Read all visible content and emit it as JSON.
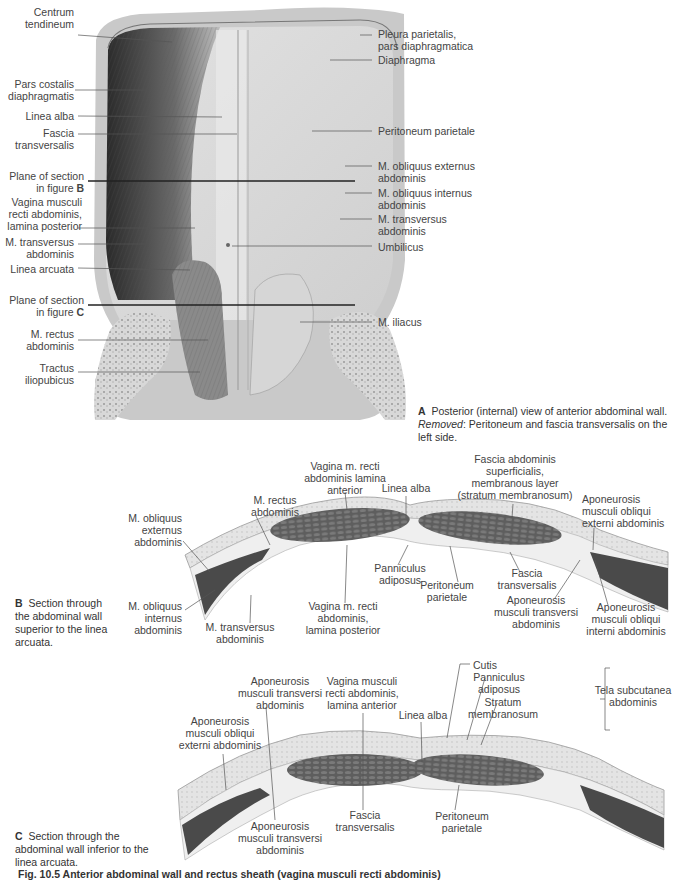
{
  "figure_a": {
    "labels_left": [
      {
        "text": "Centrum\ntendineum",
        "x": 28,
        "y": 11
      },
      {
        "text": "Pars costalis\ndiaphragmatis",
        "x": 8,
        "y": 82
      },
      {
        "text": "Linea alba",
        "x": 30,
        "y": 111
      },
      {
        "text": "Fascia\ntransversalis",
        "x": 20,
        "y": 128
      },
      {
        "text": "Plane of section\nin figure ",
        "bold": "B",
        "x": 20,
        "y": 169
      },
      {
        "text": "Vagina musculi\nrecti abdominis,\nlamina posterior",
        "x": 15,
        "y": 195
      },
      {
        "text": "M. transversus\nabdominis",
        "x": 12,
        "y": 238
      },
      {
        "text": "Linea arcuata",
        "x": 17,
        "y": 265
      },
      {
        "text": "Plane of section\nin figure ",
        "bold": "C",
        "x": 20,
        "y": 295
      },
      {
        "text": "M. rectus\nabdominis",
        "x": 30,
        "y": 328
      },
      {
        "text": "Tractus\niliopubicus",
        "x": 28,
        "y": 363
      }
    ],
    "labels_right": [
      {
        "text": "Pleura parietalis,\npars diaphragmatica",
        "x": 378,
        "y": 28
      },
      {
        "text": "Diaphragma",
        "x": 378,
        "y": 54
      },
      {
        "text": "Peritoneum parietale",
        "x": 378,
        "y": 125
      },
      {
        "text": "M. obliquus externus\nabdominis",
        "x": 378,
        "y": 161
      },
      {
        "text": "M. obliquus internus\nabdominis",
        "x": 378,
        "y": 188
      },
      {
        "text": "M. transversus\nabdominis",
        "x": 378,
        "y": 214
      },
      {
        "text": "Umbilicus",
        "x": 378,
        "y": 241
      },
      {
        "text": "M. iliacus",
        "x": 378,
        "y": 316
      }
    ],
    "caption_letter": "A",
    "caption_text": "Posterior (internal) view of anterior abdominal wall.",
    "caption_removed_label": "Removed",
    "caption_removed_text": ": Peritoneum and fascia transversalis on the left side."
  },
  "figure_b": {
    "labels": [
      {
        "text": "Vagina m. recti\nabdominis lamina\nanterior",
        "x": 318,
        "y": 460,
        "align": "c"
      },
      {
        "text": "Linea alba",
        "x": 404,
        "y": 482,
        "align": "c"
      },
      {
        "text": "Fascia abdominis\nsuperficialis,\nmembranous layer\n(stratum membranosum)",
        "x": 478,
        "y": 453,
        "align": "c"
      },
      {
        "text": "M. rectus\nabdominis",
        "x": 275,
        "y": 494,
        "align": "c"
      },
      {
        "text": "Aponeurosis\nmusculi obliqui\nexterni abdominis",
        "x": 582,
        "y": 493,
        "align": "l"
      },
      {
        "text": "M. obliquus\nexternus\nabdominis",
        "x": 180,
        "y": 512,
        "align": "r"
      },
      {
        "text": "Panniculus\nadiposus",
        "x": 400,
        "y": 562,
        "align": "c"
      },
      {
        "text": "Peritoneum\nparietale",
        "x": 446,
        "y": 579,
        "align": "c"
      },
      {
        "text": "Fascia\ntransversalis",
        "x": 527,
        "y": 567,
        "align": "c"
      },
      {
        "text": "Aponeurosis\nmusculi transversi\nabdominis",
        "x": 535,
        "y": 594,
        "align": "c"
      },
      {
        "text": "Aponeurosis\nmusculi obliqui\ninterni abdominis",
        "x": 626,
        "y": 601,
        "align": "c"
      },
      {
        "text": "M. obliquus\ninternus\nabdominis",
        "x": 180,
        "y": 600,
        "align": "r"
      },
      {
        "text": "M. transversus\nabdominis",
        "x": 240,
        "y": 621,
        "align": "c"
      },
      {
        "text": "Vagina m. recti\nabdominis,\nlamina posterior",
        "x": 342,
        "y": 600,
        "align": "c"
      }
    ],
    "caption_letter": "B",
    "caption_text": "Section through the abdominal wall superior to the linea arcuata."
  },
  "figure_c": {
    "labels": [
      {
        "text": "Cutis",
        "x": 473,
        "y": 661,
        "align": "l"
      },
      {
        "text": "Panniculus\nadiposus",
        "x": 489,
        "y": 672,
        "align": "c"
      },
      {
        "text": "Tela subcutanea\nabdominis",
        "x": 574,
        "y": 684,
        "align": "c"
      },
      {
        "text": "Aponeurosis\nmusculi transversi\nabdominis",
        "x": 280,
        "y": 676,
        "align": "c"
      },
      {
        "text": "Vagina musculi\nrecti abdominis,\nlamina anterior",
        "x": 362,
        "y": 676,
        "align": "c"
      },
      {
        "text": "Stratum\nmembranosum",
        "x": 500,
        "y": 697,
        "align": "c"
      },
      {
        "text": "Linea alba",
        "x": 423,
        "y": 710,
        "align": "c"
      },
      {
        "text": "Aponeurosis\nmusculi obliqui\nexterni abdominis",
        "x": 218,
        "y": 716,
        "align": "c"
      },
      {
        "text": "Fascia\ntransversalis",
        "x": 365,
        "y": 809,
        "align": "c"
      },
      {
        "text": "Peritoneum\nparietale",
        "x": 462,
        "y": 810,
        "align": "c"
      },
      {
        "text": "Aponeurosis\nmusculi transversi\nabdominis",
        "x": 278,
        "y": 820,
        "align": "c"
      }
    ],
    "caption_letter": "C",
    "caption_text": "Section through the abdominal wall inferior to the linea arcuata."
  },
  "figure_caption": "Fig. 10.5 Anterior abdominal wall and rectus sheath (vagina musculi recti abdominis)"
}
